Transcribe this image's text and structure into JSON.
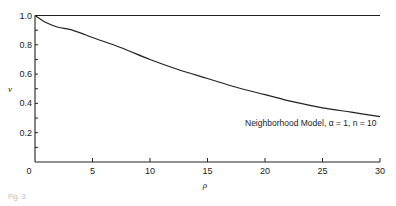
{
  "chart_data": {
    "type": "line",
    "title": "",
    "xlabel": "ρ",
    "ylabel": "v",
    "xlim": [
      0,
      30
    ],
    "ylim": [
      0,
      1.0
    ],
    "xticks": [
      0,
      5,
      10,
      15,
      20,
      25,
      30
    ],
    "yticks": [
      0.2,
      0.4,
      0.6,
      0.8,
      1.0
    ],
    "xtick_labels": [
      "0",
      "5",
      "10",
      "15",
      "20",
      "25",
      "30"
    ],
    "ytick_labels": [
      "0.2",
      "0.4",
      "0.6",
      "0.8",
      "1.0"
    ],
    "grid": false,
    "series": [
      {
        "name": "Reference v = 1",
        "x": [
          0,
          30
        ],
        "y": [
          1.0,
          1.0
        ]
      },
      {
        "name": "Neighborhood Model, α = 1, n = 10",
        "x": [
          0,
          1,
          2,
          3,
          4,
          5,
          7.5,
          10,
          12.5,
          15,
          17.5,
          20,
          22.5,
          25,
          27.5,
          30
        ],
        "y": [
          1.0,
          0.95,
          0.92,
          0.905,
          0.88,
          0.85,
          0.78,
          0.7,
          0.63,
          0.57,
          0.51,
          0.46,
          0.41,
          0.37,
          0.34,
          0.31
        ]
      }
    ],
    "annotations": [
      {
        "text": "Neighborhood Model, α = 1, n = 10",
        "x": 18.5,
        "y": 0.23
      }
    ]
  },
  "labels": {
    "x_axis": "ρ",
    "y_axis": "v",
    "origin": "0",
    "annotation": "Neighborhood Model, α = 1, n = 10",
    "caption": "Fig. 3"
  }
}
